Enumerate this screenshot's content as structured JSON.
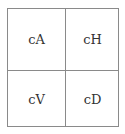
{
  "diagram": {
    "type": "wavelet-subband-grid",
    "cells": [
      {
        "position": "top-left",
        "label": "cA"
      },
      {
        "position": "top-right",
        "label": "cH"
      },
      {
        "position": "bottom-left",
        "label": "cV"
      },
      {
        "position": "bottom-right",
        "label": "cD"
      }
    ]
  }
}
